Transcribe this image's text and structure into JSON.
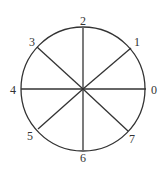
{
  "diagram": {
    "type": "circle-divided-by-8-spokes",
    "stroke_color": "#333333",
    "background": "#ffffff",
    "center": [
      83,
      89
    ],
    "radius": 62,
    "labels": [
      {
        "text": "0",
        "x": 151,
        "y": 94
      },
      {
        "text": "1",
        "x": 134,
        "y": 46
      },
      {
        "text": "2",
        "x": 80,
        "y": 25
      },
      {
        "text": "3",
        "x": 29,
        "y": 46
      },
      {
        "text": "4",
        "x": 10,
        "y": 94
      },
      {
        "text": "5",
        "x": 27,
        "y": 140
      },
      {
        "text": "6",
        "x": 80,
        "y": 162
      },
      {
        "text": "7",
        "x": 129,
        "y": 143
      }
    ],
    "spokes": [
      {
        "to": "0",
        "x2": 146,
        "y2": 89
      },
      {
        "to": "1",
        "x2": 131,
        "y2": 48
      },
      {
        "to": "2",
        "x2": 83,
        "y2": 28
      },
      {
        "to": "3",
        "x2": 37,
        "y2": 47
      },
      {
        "to": "4",
        "x2": 21,
        "y2": 89
      },
      {
        "to": "5",
        "x2": 38,
        "y2": 129
      },
      {
        "to": "6",
        "x2": 83,
        "y2": 150
      },
      {
        "to": "7",
        "x2": 128,
        "y2": 131
      }
    ]
  }
}
